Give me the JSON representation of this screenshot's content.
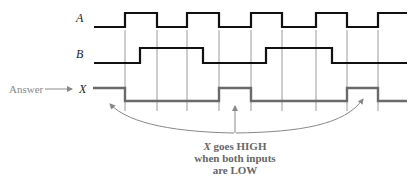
{
  "diagram": {
    "signals": [
      {
        "label": "A",
        "high_y": 13,
        "low_y": 27,
        "color": "#111111",
        "points": [
          [
            94,
            27
          ],
          [
            125,
            27
          ],
          [
            125,
            13
          ],
          [
            157,
            13
          ],
          [
            157,
            27
          ],
          [
            187,
            27
          ],
          [
            187,
            13
          ],
          [
            219,
            13
          ],
          [
            219,
            27
          ],
          [
            251,
            27
          ],
          [
            251,
            13
          ],
          [
            282,
            13
          ],
          [
            282,
            27
          ],
          [
            316,
            27
          ],
          [
            316,
            13
          ],
          [
            347,
            13
          ],
          [
            347,
            27
          ],
          [
            378,
            27
          ],
          [
            378,
            13
          ],
          [
            407,
            13
          ]
        ]
      },
      {
        "label": "B",
        "high_y": 48,
        "low_y": 63,
        "color": "#111111",
        "points": [
          [
            94,
            63
          ],
          [
            140,
            63
          ],
          [
            140,
            48
          ],
          [
            203,
            48
          ],
          [
            203,
            63
          ],
          [
            266,
            63
          ],
          [
            266,
            48
          ],
          [
            332,
            48
          ],
          [
            332,
            63
          ],
          [
            407,
            63
          ]
        ]
      },
      {
        "label": "X",
        "high_y": 88,
        "low_y": 101,
        "color": "#6a6a6a",
        "points": [
          [
            93,
            88
          ],
          [
            125,
            88
          ],
          [
            125,
            101
          ],
          [
            219,
            101
          ],
          [
            219,
            88
          ],
          [
            251,
            88
          ],
          [
            251,
            101
          ],
          [
            347,
            101
          ],
          [
            347,
            88
          ],
          [
            378,
            88
          ],
          [
            378,
            101
          ],
          [
            407,
            101
          ]
        ]
      }
    ],
    "gridlines_x": [
      125,
      157,
      187,
      219,
      251,
      282,
      316,
      347,
      378
    ],
    "gridline_y_top": 30,
    "gridline_y_bottom": 111,
    "answer_label": "Answer",
    "note_lines": [
      "X goes HIGH",
      "when both inputs",
      "are LOW"
    ],
    "note_italic_prefix": "X",
    "colors": {
      "signal": "#111111",
      "output": "#6a6a6a",
      "grid": "#9a9a9a",
      "annotation": "#888888"
    }
  }
}
